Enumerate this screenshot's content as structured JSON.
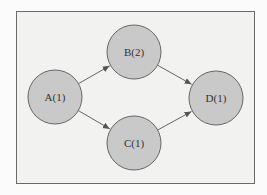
{
  "diagram": {
    "type": "directed-graph",
    "nodes": [
      {
        "id": "A",
        "label": "A(1)",
        "cx": 55,
        "cy": 97,
        "r": 27
      },
      {
        "id": "B",
        "label": "B(2)",
        "cx": 134,
        "cy": 52,
        "r": 27
      },
      {
        "id": "C",
        "label": "C(1)",
        "cx": 134,
        "cy": 143,
        "r": 27
      },
      {
        "id": "D",
        "label": "D(1)",
        "cx": 216,
        "cy": 98,
        "r": 27
      }
    ],
    "edges": [
      {
        "from": "A",
        "to": "B"
      },
      {
        "from": "A",
        "to": "C"
      },
      {
        "from": "B",
        "to": "D"
      },
      {
        "from": "C",
        "to": "D"
      }
    ],
    "colors": {
      "node_fill": "#c9c9c9",
      "node_stroke": "#666666",
      "edge": "#555555"
    }
  }
}
